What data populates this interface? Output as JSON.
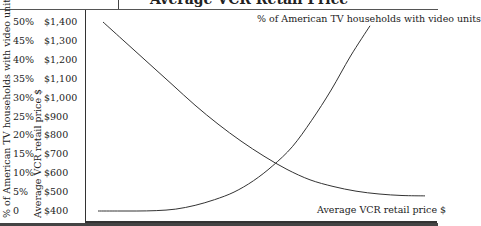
{
  "chart_data": {
    "type": "line",
    "x": [
      0,
      1,
      2,
      3,
      4,
      5,
      6,
      7,
      8,
      9,
      10,
      11,
      12,
      13,
      14
    ],
    "xlabel": "",
    "y_axes": {
      "left_outer": {
        "label": "% of American TV households with video units",
        "ticks": [
          "50%",
          "45%",
          "40%",
          "35%",
          "30%",
          "25%",
          "20%",
          "15%",
          "10%",
          "5%",
          "0"
        ],
        "range": [
          0,
          50
        ]
      },
      "left_inner": {
        "label": "Average VCR retail price $",
        "ticks": [
          "$1,400",
          "$1,300",
          "$1,200",
          "$1,100",
          "$1,000",
          "$900",
          "$800",
          "$700",
          "$600",
          "$500",
          "$400"
        ],
        "range": [
          400,
          1400
        ]
      }
    },
    "series": [
      {
        "name": "% of American TV households with video units",
        "axis": "left_outer",
        "values": [
          0,
          0,
          0,
          0.1,
          0.5,
          1.5,
          3,
          5,
          8,
          12,
          17,
          24,
          32,
          41,
          49
        ]
      },
      {
        "name": "Average VCR retail price $",
        "axis": "left_inner",
        "values": [
          1400,
          1290,
          1180,
          1070,
          960,
          860,
          770,
          690,
          620,
          565,
          530,
          505,
          490,
          482,
          480
        ]
      }
    ],
    "annotations": [
      {
        "text": "% of American TV households with video units",
        "position": "top-right"
      },
      {
        "text": "Average VCR retail price $",
        "position": "bottom-right"
      }
    ],
    "grid": false,
    "legend": "inline labels"
  },
  "title_fragment": "Average VCR Retail Price",
  "axes": {
    "pct_label": "% of American TV households with video units",
    "usd_label": "Average VCR retail price $",
    "pct_ticks": [
      "50%",
      "45%",
      "40%",
      "35%",
      "30%",
      "25%",
      "20%",
      "15%",
      "10%",
      "5%",
      "0"
    ],
    "usd_ticks": [
      "$1,400",
      "$1,300",
      "$1,200",
      "$1,100",
      "$1,000",
      "$900",
      "$800",
      "$700",
      "$600",
      "$500",
      "$400"
    ]
  },
  "labels": {
    "households": "% of American TV households with video units",
    "price": "Average VCR retail price $"
  },
  "colors": {
    "line": "#333333",
    "frame": "#333333",
    "text": "#1a1a1a"
  }
}
